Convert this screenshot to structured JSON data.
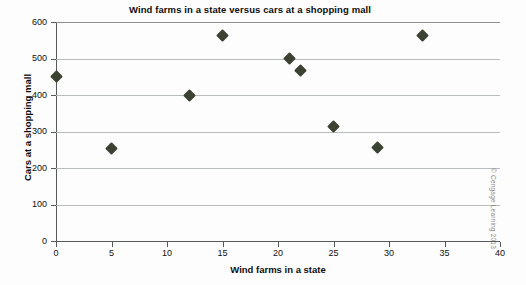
{
  "chart_data": {
    "type": "scatter",
    "title": "Wind farms in a state versus cars at a shopping mall",
    "xlabel": "Wind farms in a state",
    "ylabel": "Cars at a shopping mall",
    "xlim": [
      0,
      40
    ],
    "ylim": [
      0,
      600
    ],
    "xticks": [
      0,
      5,
      10,
      15,
      20,
      25,
      30,
      35,
      40
    ],
    "yticks": [
      0,
      100,
      200,
      300,
      400,
      500,
      600
    ],
    "grid": "horizontal",
    "legend": "none",
    "marker": "diamond",
    "marker_color": "#3b4232",
    "points": [
      {
        "x": 0,
        "y": 452
      },
      {
        "x": 5,
        "y": 253
      },
      {
        "x": 12,
        "y": 400
      },
      {
        "x": 15,
        "y": 562
      },
      {
        "x": 21,
        "y": 500
      },
      {
        "x": 22,
        "y": 468
      },
      {
        "x": 25,
        "y": 313
      },
      {
        "x": 29,
        "y": 257
      },
      {
        "x": 33,
        "y": 562
      }
    ],
    "annotations": {
      "credit": "© Cengage Learning 2013"
    }
  },
  "axes": {
    "x_tick_labels": [
      "0",
      "5",
      "10",
      "15",
      "20",
      "25",
      "30",
      "35",
      "40"
    ],
    "y_tick_labels": [
      "0",
      "100",
      "200",
      "300",
      "400",
      "500",
      "600"
    ]
  }
}
